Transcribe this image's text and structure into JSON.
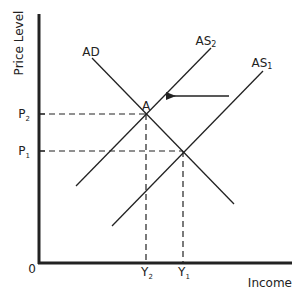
{
  "diagram": {
    "type": "AD-AS economic diagram",
    "axes": {
      "y_label": "Price Level",
      "x_label": "Income",
      "origin_label": "0"
    },
    "curves": {
      "ad": {
        "label": "AD"
      },
      "as1": {
        "label": "AS",
        "subscript": "1"
      },
      "as2": {
        "label": "AS",
        "subscript": "2"
      }
    },
    "equilibria": {
      "a": {
        "label": "A"
      }
    },
    "price_ticks": {
      "p2": {
        "label": "P",
        "subscript": "2"
      },
      "p1": {
        "label": "P",
        "subscript": "1"
      }
    },
    "income_ticks": {
      "y2": {
        "label": "Y",
        "subscript": "2"
      },
      "y1": {
        "label": "Y",
        "subscript": "1"
      }
    },
    "shift_arrow": {
      "direction": "left",
      "meaning": "AS shifts from AS1 to AS2"
    },
    "colors": {
      "line": "#222222",
      "background": "#ffffff"
    }
  }
}
